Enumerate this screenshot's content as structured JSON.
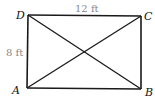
{
  "diagram": {
    "type": "rectangle-with-diagonals",
    "vertices": [
      {
        "label": "A",
        "x": 27,
        "y": 88
      },
      {
        "label": "B",
        "x": 141,
        "y": 89
      },
      {
        "label": "C",
        "x": 141,
        "y": 16
      },
      {
        "label": "D",
        "x": 28,
        "y": 15
      }
    ],
    "dimensions": {
      "top": "12 ft",
      "left": "8 ft"
    },
    "colors": {
      "stroke": "#1a1a1a",
      "dimension_text": "#888888"
    }
  }
}
